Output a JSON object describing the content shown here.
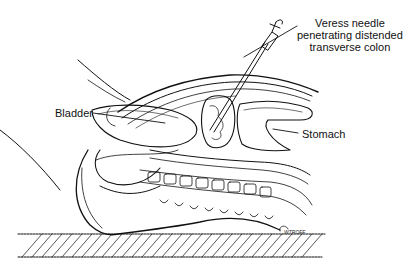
{
  "figure": {
    "labels": {
      "veress": {
        "line1": "Veress needle",
        "line2": "penetrating distended",
        "line3": "transverse colon"
      },
      "bladder": "Bladder",
      "stomach": "Stomach"
    },
    "signature": "WTROFF",
    "colors": {
      "ink": "#111111",
      "background": "#ffffff"
    }
  }
}
